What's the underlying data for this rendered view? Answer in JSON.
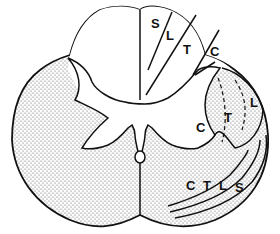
{
  "diagram": {
    "colors": {
      "background": "#ffffff",
      "outline": "#111111",
      "white_matter_stipple": "#555555",
      "gray_matter": "#ffffff"
    },
    "dorsal_column_labels": [
      "S",
      "L",
      "T",
      "C"
    ],
    "lateral_upper_tract_labels": [
      "C",
      "T",
      "L"
    ],
    "lateral_lower_tract_labels": [
      "C",
      "T",
      "L",
      "S"
    ]
  }
}
